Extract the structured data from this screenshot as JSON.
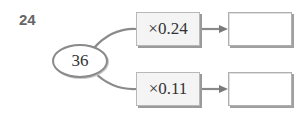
{
  "problem": {
    "number": "24"
  },
  "input": {
    "value": "36"
  },
  "branches": [
    {
      "operation": "×0.24",
      "result": ""
    },
    {
      "operation": "×0.11",
      "result": ""
    }
  ],
  "colors": {
    "line": "#8a8a8a",
    "box_fill": "#f4f4f4",
    "number": "#666666"
  }
}
